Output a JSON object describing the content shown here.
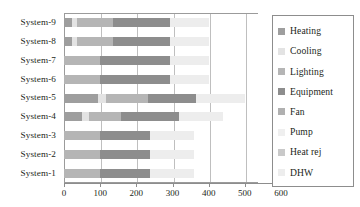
{
  "chart_data": {
    "type": "bar",
    "orientation": "horizontal",
    "stacked": true,
    "title": "",
    "xlabel": "",
    "ylabel": "",
    "xlim": [
      0,
      600
    ],
    "ylim": null,
    "grid": true,
    "xticks": [
      0,
      100,
      200,
      300,
      400,
      500,
      600
    ],
    "xticklabels": [
      "0",
      "100",
      "200",
      "300",
      "400",
      "500",
      "600"
    ],
    "legend_position": "right",
    "categories": [
      "System-1",
      "System-2",
      "System-3",
      "System-4",
      "System-5",
      "System-6",
      "System-7",
      "System-8",
      "System-9"
    ],
    "series": [
      {
        "name": "Heating",
        "color": "#9e9e9e",
        "values": [
          0,
          0,
          0,
          50,
          95,
          0,
          0,
          22,
          22
        ]
      },
      {
        "name": "Cooling",
        "color": "#e3e3e3",
        "values": [
          0,
          0,
          0,
          18,
          22,
          0,
          0,
          14,
          14
        ]
      },
      {
        "name": "Lighting",
        "color": "#b5b5b5",
        "values": [
          100,
          100,
          100,
          90,
          116,
          100,
          100,
          100,
          100
        ]
      },
      {
        "name": "Equipment",
        "color": "#8d8d8d",
        "values": [
          138,
          138,
          138,
          160,
          132,
          192,
          192,
          156,
          156
        ]
      },
      {
        "name": "Fan",
        "color": "#b0b0b0",
        "values": [
          0,
          0,
          0,
          0,
          0,
          0,
          0,
          0,
          0
        ]
      },
      {
        "name": "Pump",
        "color": "#efefef",
        "values": [
          0,
          0,
          0,
          0,
          0,
          0,
          0,
          0,
          0
        ]
      },
      {
        "name": "Heat rej",
        "color": "#c9c9c9",
        "values": [
          0,
          0,
          0,
          0,
          0,
          0,
          0,
          0,
          0
        ]
      },
      {
        "name": "DHW",
        "color": "#ededed",
        "values": [
          122,
          122,
          122,
          122,
          135,
          108,
          108,
          108,
          108
        ]
      }
    ],
    "totals": [
      360,
      360,
      360,
      440,
      500,
      400,
      400,
      400,
      400
    ]
  },
  "legend": {
    "items": [
      {
        "label": "Heating",
        "color": "#9e9e9e"
      },
      {
        "label": "Cooling",
        "color": "#e3e3e3"
      },
      {
        "label": "Lighting",
        "color": "#b5b5b5"
      },
      {
        "label": "Equipment",
        "color": "#8d8d8d"
      },
      {
        "label": "Fan",
        "color": "#b0b0b0"
      },
      {
        "label": "Pump",
        "color": "#efefef"
      },
      {
        "label": "Heat rej",
        "color": "#c9c9c9"
      },
      {
        "label": "DHW",
        "color": "#ededed"
      }
    ]
  }
}
